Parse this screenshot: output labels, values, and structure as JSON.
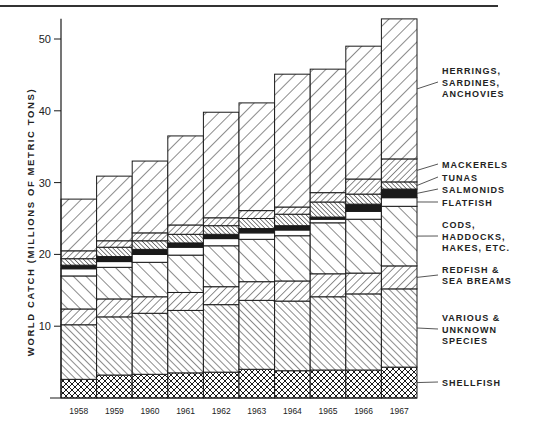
{
  "chart_data": {
    "type": "bar",
    "stacked": true,
    "title": "",
    "xlabel": "",
    "ylabel": "WORLD CATCH (MILLIONS OF METRIC TONS)",
    "ylim": [
      0,
      52
    ],
    "yticks": [
      10,
      20,
      30,
      40,
      50
    ],
    "grid": false,
    "legend_position": "right (direct labels with leader lines)",
    "categories": [
      "1958",
      "1959",
      "1960",
      "1961",
      "1962",
      "1963",
      "1964",
      "1965",
      "1966",
      "1967"
    ],
    "series": [
      {
        "name": "SHELLFISH",
        "label_lines": [
          "SHELLFISH"
        ],
        "pattern": "crosshatch",
        "values": [
          2.6,
          3.2,
          3.3,
          3.5,
          3.6,
          4.0,
          3.8,
          3.9,
          3.9,
          4.3
        ]
      },
      {
        "name": "VARIOUS & UNKNOWN SPECIES",
        "label_lines": [
          "VARIOUS &",
          "UNKNOWN",
          "SPECIES"
        ],
        "pattern": "back-diagonal-fine",
        "values": [
          7.6,
          8.1,
          8.5,
          8.7,
          9.4,
          9.6,
          9.7,
          10.2,
          10.6,
          10.9
        ]
      },
      {
        "name": "REDFISH & SEA BREAMS",
        "label_lines": [
          "REDFISH &",
          "SEA BREAMS"
        ],
        "pattern": "diagonal-medium",
        "values": [
          2.2,
          2.5,
          2.3,
          2.5,
          2.5,
          2.6,
          2.8,
          3.2,
          2.9,
          3.2
        ]
      },
      {
        "name": "CODS, HADDOCKS, HAKES, ETC.",
        "label_lines": [
          "CODS,",
          "HADDOCKS,",
          "HAKES, ETC."
        ],
        "pattern": "back-diagonal-wide",
        "values": [
          4.6,
          4.4,
          4.8,
          5.2,
          5.7,
          5.9,
          6.3,
          7.1,
          7.5,
          8.3
        ]
      },
      {
        "name": "FLATFISH",
        "label_lines": [
          "FLATFISH"
        ],
        "pattern": "blank",
        "values": [
          1.0,
          0.8,
          1.1,
          1.1,
          1.0,
          0.9,
          0.8,
          0.5,
          1.1,
          1.2
        ]
      },
      {
        "name": "SALMONIDS",
        "label_lines": [
          "SALMONIDS"
        ],
        "pattern": "solid",
        "values": [
          0.5,
          0.7,
          0.7,
          0.6,
          0.6,
          0.6,
          0.6,
          0.3,
          1.0,
          1.2
        ]
      },
      {
        "name": "TUNAS",
        "label_lines": [
          "TUNAS"
        ],
        "pattern": "back-diagonal-dense",
        "values": [
          0.9,
          1.3,
          1.2,
          1.2,
          1.2,
          1.4,
          1.6,
          2.1,
          1.4,
          1.0
        ]
      },
      {
        "name": "MACKERELS",
        "label_lines": [
          "MACKERELS"
        ],
        "pattern": "diagonal-fine",
        "values": [
          1.1,
          0.9,
          1.1,
          1.3,
          1.1,
          1.1,
          1.0,
          1.3,
          2.1,
          3.2
        ]
      },
      {
        "name": "HERRINGS, SARDINES, ANCHOVIES",
        "label_lines": [
          "HERRINGS,",
          "SARDINES,",
          "ANCHOVIES"
        ],
        "pattern": "diagonal-wide",
        "values": [
          7.2,
          9.0,
          10.0,
          12.4,
          14.7,
          15.0,
          18.5,
          17.2,
          18.5,
          19.5
        ]
      }
    ],
    "totals": [
      27.7,
      30.9,
      33.0,
      36.5,
      39.8,
      41.1,
      45.1,
      45.8,
      49.0,
      52.8
    ]
  },
  "colors": {
    "ink": "#1a1a1a",
    "background": "#ffffff"
  }
}
